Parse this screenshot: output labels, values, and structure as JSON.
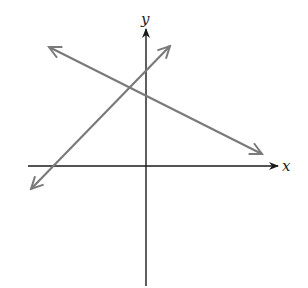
{
  "diagram": {
    "type": "coordinate-plane-two-lines",
    "axes": {
      "x_label": "x",
      "y_label": "y",
      "color": "#1a1a1a"
    },
    "lines": [
      {
        "name": "increasing-line",
        "slope_sign": "positive",
        "color": "#7a7a7a"
      },
      {
        "name": "decreasing-line",
        "slope_sign": "negative",
        "color": "#7a7a7a"
      }
    ]
  }
}
